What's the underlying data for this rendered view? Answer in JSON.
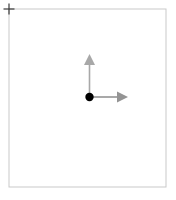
{
  "canvas": {
    "width": 176,
    "height": 200,
    "background": "#ffffff",
    "title": "2D coordinate frame"
  },
  "viewport_frame": {
    "label": "viewport-boundary",
    "x": 9,
    "y": 9,
    "width": 157,
    "height": 178,
    "stroke": "#c9c9c9",
    "stroke_width": 1,
    "fill": "none"
  },
  "corner_marker": {
    "label": "origin crosshair handle",
    "shape": "plus",
    "cx": 9,
    "cy": 9,
    "arm_length": 5.5,
    "stroke": "#3a3a3a",
    "stroke_width": 1.2
  },
  "origin_point": {
    "label": "origin",
    "cx": 89.5,
    "cy": 97,
    "radius": 4.2,
    "fill": "#000000"
  },
  "axes": [
    {
      "name": "y-axis",
      "direction": "up",
      "color": "#a8a8a8",
      "shaft_width": 1.6,
      "start_x": 89.5,
      "start_y": 97,
      "end_x": 89.5,
      "end_y": 65,
      "head_tip_x": 89.5,
      "head_tip_y": 54,
      "head_width": 11,
      "head_length": 11,
      "length": 43
    },
    {
      "name": "x-axis",
      "direction": "right",
      "color": "#949494",
      "shaft_width": 1.6,
      "start_x": 89.5,
      "start_y": 97,
      "end_x": 117,
      "end_y": 97,
      "head_tip_x": 128,
      "head_tip_y": 97,
      "head_width": 11,
      "head_length": 11,
      "length": 38.5
    }
  ],
  "palette": {
    "background": "#ffffff",
    "frame_stroke": "#c9c9c9",
    "marker_stroke": "#3a3a3a",
    "origin_fill": "#000000",
    "y_axis": "#a8a8a8",
    "x_axis": "#949494"
  }
}
